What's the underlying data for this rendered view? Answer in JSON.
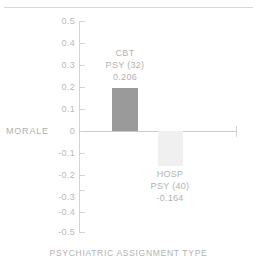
{
  "chart_data": {
    "type": "bar",
    "title": "",
    "xlabel": "PSYCHIATRIC ASSIGNMENT TYPE",
    "ylabel": "MORALE",
    "categories": [
      "CBT PSY (32)",
      "HOSP PSY (40)"
    ],
    "values": [
      0.206,
      -0.164
    ],
    "ylim": [
      -0.5,
      0.5
    ],
    "grid": false,
    "legend": "none",
    "yticks": [
      "0.5",
      "0.4",
      "0.3",
      "0.2",
      "0.1",
      "0",
      "-0.1",
      "-0.2",
      "-0.3",
      "-0.4",
      "-0.5"
    ],
    "ytick_values": [
      0.5,
      0.4,
      0.3,
      0.2,
      0.1,
      0,
      -0.1,
      -0.2,
      -0.3,
      -0.4,
      -0.5
    ],
    "bars": [
      {
        "name": "CBT",
        "group_line1": "CBT",
        "group_line2": "PSY (32)",
        "value": 0.206,
        "value_label": "0.206",
        "count": 32,
        "color": "#9a9a9a"
      },
      {
        "name": "HOSP",
        "group_line1": "HOSP",
        "group_line2": "PSY (40)",
        "value": -0.164,
        "value_label": "-0.164",
        "count": 40,
        "color": "#f0f0f0"
      }
    ],
    "colors": {
      "bar_positive": "#9a9a9a",
      "bar_negative": "#f0f0f0",
      "axis": "#d3d3d3",
      "text": "#b2b2b2",
      "background": "#ffffff"
    }
  }
}
